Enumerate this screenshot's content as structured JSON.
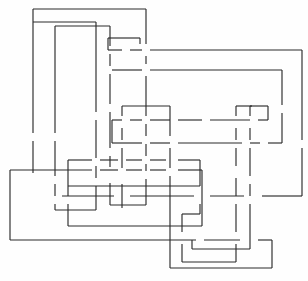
{
  "figure": {
    "style": "line-art",
    "background_color": "#fefefe",
    "stroke_color": "#2b2b2b",
    "stroke_width": 1.15,
    "width": 308,
    "height": 281,
    "gap_size": 7
  },
  "strands": [
    {
      "name": "loop-outer-upper-left",
      "label": "A",
      "color": "#2b2b2b",
      "segments": [
        "M 33 148 L 33 9 L 146 9 L 146 63",
        "M 146 77 L 146 116",
        "M 146 131 L 146 168",
        "M 146 182 L 146 205 L 110 205 L 110 185",
        "M 110 171 L 110 154",
        "M 110 140 L 110 124",
        "M 110 110 L 110 61 L 55 61 L 55 148"
      ]
    },
    {
      "name": "loop-inner-upper-left",
      "label": "B",
      "color": "#2b2b2b",
      "segments": [
        "M 55 148 L 55 176",
        "M 55 190 L 55 203 L 96 203 L 96 186",
        "M 96 172 L 96 155",
        "M 96 141 L 96 125",
        "M 96 110 L 96 46 L 127 46 L 127 22 L 33 22 L 33 134",
        "M 33 148"
      ]
    },
    {
      "name": "loop-upper-right-big",
      "label": "C",
      "color": "#2b2b2b",
      "segments": [
        "M 110 50 L 144 50",
        "M 158 50 L 302 50 L 302 140",
        "M 302 154 L 302 196",
        "M 288 196 L 262 196",
        "M 248 196 L 196 196",
        "M 182 196 L 112 196"
      ]
    },
    {
      "name": "loop-mid-horizontal-upper",
      "label": "D",
      "color": "#2b2b2b",
      "segments": [
        "M 110 70 L 144 70",
        "M 158 70 L 282 70 L 282 104",
        "M 282 118 L 282 140",
        "M 268 140 L 196 140",
        "M 182 140 L 144 140",
        "M 130 140 L 110 140"
      ]
    },
    {
      "name": "loop-center-rect",
      "label": "E",
      "color": "#2b2b2b",
      "segments": [
        "M 110 120 L 144 120",
        "M 158 120 L 168 120",
        "M 182 120 L 196 120",
        "M 210 120 L 256 120",
        "M 270 120 L 272 120 L 272 107 L 252 107 L 252 140",
        "M 252 154 L 252 176",
        "M 252 190 L 252 253 L 192 253 L 192 240"
      ]
    },
    {
      "name": "loop-lower-left-outer",
      "label": "F",
      "color": "#2b2b2b",
      "segments": [
        "M 10 175 L 10 240 L 200 240",
        "M 214 240 L 248 240",
        "M 262 240 L 270 240 L 270 268 L 170 268 L 170 175",
        "M 170 161 L 170 140",
        "M 170 126 L 170 106 L 120 106 L 120 140",
        "M 120 154 L 120 172",
        "M 120 186 L 120 204"
      ]
    },
    {
      "name": "loop-lower-left-inner",
      "label": "G",
      "color": "#2b2b2b",
      "segments": [
        "M 10 175 L 94 175",
        "M 108 175 L 120 175",
        "M 134 175 L 168 175",
        "M 182 175 L 204 175 L 204 228 L 70 228 L 70 196",
        "M 70 182 L 70 160 L 140 160",
        "M 154 160 L 168 160",
        "M 182 160 L 202 160 L 202 190",
        "M 202 204 L 202 214 L 186 214 L 186 232"
      ]
    },
    {
      "name": "loop-right-tall",
      "label": "H",
      "color": "#2b2b2b",
      "segments": [
        "M 258 106 L 258 140",
        "M 258 154 L 258 175",
        "M 258 190 L 258 225",
        "M 258 240 L 258 262 L 174 262 L 174 245",
        "M 174 231 L 174 212 L 204 212"
      ]
    }
  ],
  "crossings": {
    "count": 28,
    "note": "Under-strands rendered with a visible gap at each crossing"
  },
  "palette": {
    "ink": "#2b2b2b",
    "paper": "#fefefe",
    "faint": "#7d7d7d"
  }
}
